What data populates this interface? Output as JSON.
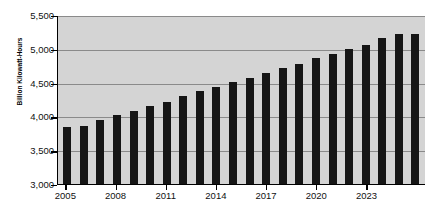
{
  "chart_data": {
    "type": "bar",
    "title": "",
    "xlabel": "",
    "ylabel": "Billion Kilowatt-Hours",
    "ylim": [
      3000,
      5500
    ],
    "ytick_labels": [
      "5,500",
      "5,000",
      "4,500",
      "4,000",
      "3,500",
      "3,000"
    ],
    "ytick_values": [
      5500,
      5000,
      4500,
      4000,
      3500,
      3000
    ],
    "grid": true,
    "legend": "none",
    "xtick_labels": [
      "2005",
      "2008",
      "2011",
      "2014",
      "2017",
      "2020",
      "2023"
    ],
    "xtick_values": [
      2005,
      2008,
      2011,
      2014,
      2017,
      2020,
      2023
    ],
    "categories": [
      "2005",
      "2006",
      "2007",
      "2008",
      "2009",
      "2010",
      "2011",
      "2012",
      "2013",
      "2014",
      "2015",
      "2016",
      "2017",
      "2018",
      "2019",
      "2020",
      "2021",
      "2022",
      "2023",
      "2024",
      "2025",
      "2026"
    ],
    "values": [
      3840,
      3865,
      3940,
      4015,
      4080,
      4160,
      4220,
      4300,
      4375,
      4430,
      4505,
      4565,
      4635,
      4715,
      4780,
      4860,
      4925,
      5000,
      5060,
      5155,
      5220,
      5220
    ],
    "bar_color": "#151515",
    "plot_background": "#d4d4d4",
    "gridline_color": "#8a8a8a"
  }
}
